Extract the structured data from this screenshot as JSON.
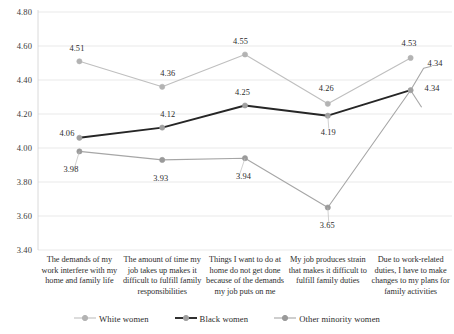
{
  "chart_data": {
    "type": "line",
    "title": "",
    "xlabel": "",
    "ylabel": "",
    "ylim": [
      3.4,
      4.8
    ],
    "ytick_step": 0.2,
    "grid": true,
    "legend_position": "bottom-center",
    "categories": [
      "The demands of my work interfere with my home and family life",
      "The amount of time my job takes up makes it difficult to fulfill family responsibilities",
      "Things I want to do at home do not get done because of the demands my job puts on me",
      "My job produces strain that makes it difficult to fulfill family duties",
      "Due to work-related duties, I have to make changes to my plans for family activities"
    ],
    "ytick_labels": [
      "4.80",
      "4.60",
      "4.40",
      "4.20",
      "4.00",
      "3.80",
      "3.60",
      "3.40"
    ],
    "ytick_values": [
      4.8,
      4.6,
      4.4,
      4.2,
      4.0,
      3.8,
      3.6,
      3.4
    ],
    "series": [
      {
        "name": "White women",
        "color": "#bfbfbf",
        "marker_color": "#b3b3b3",
        "values": [
          4.51,
          4.36,
          4.55,
          4.26,
          4.53
        ],
        "labels": [
          "4.51",
          "4.36",
          "4.55",
          "4.26",
          "4.53"
        ]
      },
      {
        "name": "Black women",
        "color": "#262626",
        "marker_color": "#a0a0a0",
        "values": [
          4.06,
          4.12,
          4.25,
          4.19,
          4.34
        ],
        "labels": [
          "4.06",
          "4.12",
          "4.25",
          "4.19",
          "4.34"
        ]
      },
      {
        "name": "Other minority women",
        "color": "#a6a6a6",
        "marker_color": "#9a9a9a",
        "values": [
          3.98,
          3.93,
          3.94,
          3.65,
          4.34
        ],
        "labels": [
          "3.98",
          "3.93",
          "3.94",
          "3.65",
          "4.34"
        ]
      }
    ]
  },
  "legend": {
    "items": [
      {
        "label": "White women"
      },
      {
        "label": "Black women"
      },
      {
        "label": "Other minority women"
      }
    ]
  }
}
